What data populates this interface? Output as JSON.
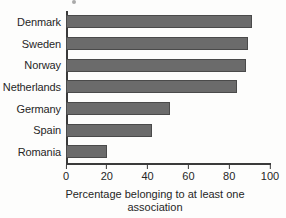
{
  "chart_data": {
    "type": "bar",
    "orientation": "horizontal",
    "title": "",
    "categories": [
      "Denmark",
      "Sweden",
      "Norway",
      "Netherlands",
      "Germany",
      "Spain",
      "Romania"
    ],
    "values": [
      91,
      89,
      88,
      84,
      51,
      42,
      20
    ],
    "xlabel_line1": "Percentage belonging to at least one",
    "xlabel_line2": "association",
    "xlabel": "Percentage belonging to at least one association",
    "ylabel": "",
    "xlim": [
      0,
      100
    ],
    "xticks": [
      0,
      20,
      40,
      60,
      80,
      100
    ],
    "xtick_labels": [
      "0",
      "20",
      "40",
      "60",
      "80",
      "100"
    ],
    "grid": false,
    "legend": false,
    "bar_color": "#6b6b6b",
    "bar_edge_color": "#4a4a4a",
    "axis_color": "#3a3a3a",
    "text_color": "#262626"
  }
}
